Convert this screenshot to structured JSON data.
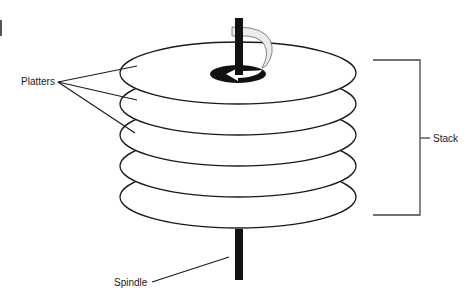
{
  "diagram": {
    "labels": {
      "platters": "Platters",
      "stack": "Stack",
      "spindle": "Spindle"
    },
    "colors": {
      "stroke": "#1a1a1a",
      "spindle": "#111111",
      "arrow_fill": "#ececec",
      "bracket": "#444444",
      "background": "#ffffff"
    },
    "platter_count": 5,
    "platters": [
      {
        "index": 1,
        "cx": 238,
        "cy": 73,
        "rx": 118,
        "ry": 30
      },
      {
        "index": 2,
        "cx": 238,
        "cy": 104,
        "rx": 118,
        "ry": 30
      },
      {
        "index": 3,
        "cx": 238,
        "cy": 135,
        "rx": 118,
        "ry": 30
      },
      {
        "index": 4,
        "cx": 238,
        "cy": 166,
        "rx": 118,
        "ry": 30
      },
      {
        "index": 5,
        "cx": 238,
        "cy": 197,
        "rx": 118,
        "ry": 30
      }
    ],
    "rotation_indicator": "rotation-arrow"
  }
}
